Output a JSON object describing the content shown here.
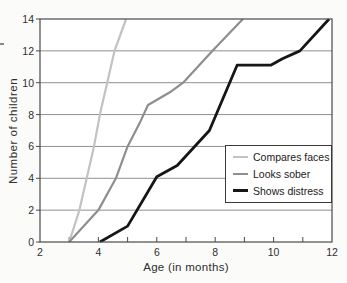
{
  "figure": {
    "x_axis_label": "Age (in months)",
    "y_axis_label": "Number of children"
  },
  "legend": {
    "position": "lower-right",
    "items": [
      {
        "label": "Compares faces",
        "color": "#c2c2c2",
        "swatch_thickness": 2
      },
      {
        "label": "Looks sober",
        "color": "#8e8e8e",
        "swatch_thickness": 2
      },
      {
        "label": "Shows distress",
        "color": "#161616",
        "swatch_thickness": 3
      }
    ]
  },
  "chart_data": {
    "type": "line",
    "title": "",
    "xlabel": "Age (in months)",
    "ylabel": "Number of children",
    "xlim": [
      2,
      12
    ],
    "ylim": [
      0,
      14
    ],
    "x_ticks": [
      2,
      4,
      6,
      8,
      10,
      12
    ],
    "x_minor_ticks": [
      3,
      4,
      5,
      6,
      7,
      8,
      9,
      10,
      11
    ],
    "y_ticks": [
      0,
      2,
      4,
      6,
      8,
      10,
      12,
      14
    ],
    "grid": "horizontal",
    "legend_position": "lower-right",
    "colors": {
      "grid": "#8f8f8f",
      "axis": "#4a4a4a",
      "plot_background": "#ffffff",
      "page_background": "#fbfbfa"
    },
    "series": [
      {
        "name": "Compares faces",
        "color": "#c2c2c2",
        "width": 2.2,
        "points": [
          [
            3,
            0
          ],
          [
            3.35,
            2
          ],
          [
            3.6,
            4
          ],
          [
            3.85,
            6
          ],
          [
            4.05,
            8
          ],
          [
            4.3,
            10
          ],
          [
            4.55,
            12
          ],
          [
            4.95,
            14
          ]
        ]
      },
      {
        "name": "Looks sober",
        "color": "#8e8e8e",
        "width": 2.2,
        "points": [
          [
            3,
            0
          ],
          [
            4,
            2
          ],
          [
            4.6,
            4
          ],
          [
            5,
            6
          ],
          [
            5.45,
            7.6
          ],
          [
            5.7,
            8.6
          ],
          [
            6.45,
            9.4
          ],
          [
            6.9,
            10
          ],
          [
            7.9,
            12
          ],
          [
            8.95,
            14
          ]
        ]
      },
      {
        "name": "Shows distress",
        "color": "#161616",
        "width": 2.8,
        "points": [
          [
            4.05,
            0
          ],
          [
            5,
            1
          ],
          [
            6,
            4.1
          ],
          [
            6.7,
            4.8
          ],
          [
            7.8,
            7
          ],
          [
            8.75,
            11.1
          ],
          [
            9.9,
            11.1
          ],
          [
            10.3,
            11.5
          ],
          [
            10.9,
            12
          ],
          [
            11.9,
            14
          ]
        ]
      }
    ]
  }
}
